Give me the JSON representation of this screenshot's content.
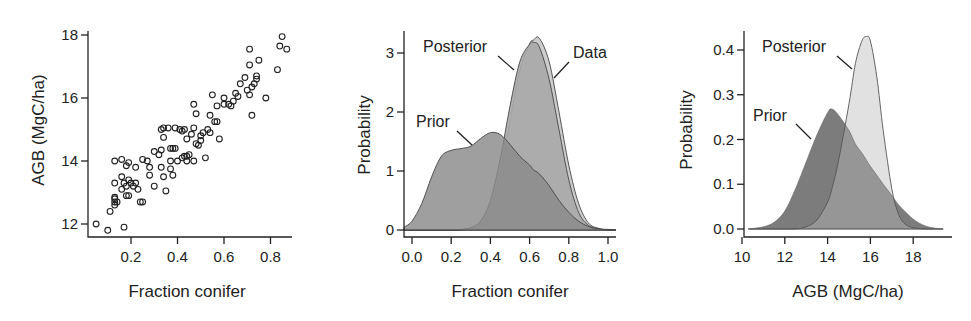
{
  "figure": {
    "panels": [
      {
        "id": "scatter",
        "xlabel": "Fraction conifer",
        "ylabel": "AGB (MgC/ha)"
      },
      {
        "id": "conifer-density",
        "xlabel": "Fraction conifer",
        "ylabel": "Probability",
        "annotations": [
          "Posterior",
          "Data",
          "Prior"
        ]
      },
      {
        "id": "agb-density",
        "xlabel": "AGB (MgC/ha)",
        "ylabel": "Probability",
        "annotations": [
          "Posterior",
          "Prior"
        ]
      }
    ]
  },
  "colors": {
    "prior_fill": "#8a8a8a",
    "posterior_fill": "#a8a8a8",
    "data_fill": "#c8c8c8",
    "overlap_fill": "#6e6e6e",
    "axis": "#222222",
    "point_stroke": "#222222"
  },
  "chart_data": [
    {
      "type": "scatter",
      "title": "",
      "xlabel": "Fraction conifer",
      "ylabel": "AGB (MgC/ha)",
      "xticks": [
        "0.2",
        "0.4",
        "0.6",
        "0.8"
      ],
      "yticks": [
        "12",
        "14",
        "16",
        "18"
      ],
      "xlim": [
        0.02,
        0.9
      ],
      "ylim": [
        11.6,
        18.1
      ],
      "grid": false,
      "points": [
        [
          0.05,
          12.0
        ],
        [
          0.1,
          11.8
        ],
        [
          0.17,
          11.9
        ],
        [
          0.11,
          12.4
        ],
        [
          0.13,
          12.6
        ],
        [
          0.13,
          12.8
        ],
        [
          0.13,
          12.7
        ],
        [
          0.14,
          12.7
        ],
        [
          0.13,
          12.85
        ],
        [
          0.13,
          13.3
        ],
        [
          0.16,
          13.5
        ],
        [
          0.16,
          13.1
        ],
        [
          0.17,
          13.3
        ],
        [
          0.18,
          13.2
        ],
        [
          0.19,
          13.4
        ],
        [
          0.2,
          13.3
        ],
        [
          0.21,
          13.2
        ],
        [
          0.22,
          13.3
        ],
        [
          0.23,
          13.1
        ],
        [
          0.18,
          12.9
        ],
        [
          0.19,
          12.9
        ],
        [
          0.24,
          12.7
        ],
        [
          0.25,
          12.7
        ],
        [
          0.13,
          14.0
        ],
        [
          0.16,
          14.05
        ],
        [
          0.18,
          13.85
        ],
        [
          0.19,
          13.95
        ],
        [
          0.22,
          13.8
        ],
        [
          0.25,
          14.05
        ],
        [
          0.27,
          14.0
        ],
        [
          0.28,
          13.8
        ],
        [
          0.28,
          13.55
        ],
        [
          0.3,
          13.2
        ],
        [
          0.3,
          14.3
        ],
        [
          0.32,
          14.2
        ],
        [
          0.33,
          14.35
        ],
        [
          0.33,
          13.8
        ],
        [
          0.34,
          13.5
        ],
        [
          0.35,
          13.05
        ],
        [
          0.37,
          14.0
        ],
        [
          0.37,
          13.75
        ],
        [
          0.38,
          13.55
        ],
        [
          0.4,
          14.0
        ],
        [
          0.42,
          14.1
        ],
        [
          0.33,
          15.0
        ],
        [
          0.34,
          15.05
        ],
        [
          0.36,
          15.05
        ],
        [
          0.39,
          15.05
        ],
        [
          0.41,
          15.0
        ],
        [
          0.42,
          14.95
        ],
        [
          0.43,
          15.0
        ],
        [
          0.34,
          14.75
        ],
        [
          0.37,
          14.4
        ],
        [
          0.38,
          14.4
        ],
        [
          0.39,
          14.4
        ],
        [
          0.43,
          14.15
        ],
        [
          0.44,
          14.15
        ],
        [
          0.45,
          14.2
        ],
        [
          0.44,
          14.0
        ],
        [
          0.47,
          14.0
        ],
        [
          0.44,
          14.7
        ],
        [
          0.46,
          14.85
        ],
        [
          0.47,
          15.05
        ],
        [
          0.48,
          14.55
        ],
        [
          0.49,
          14.5
        ],
        [
          0.5,
          14.65
        ],
        [
          0.5,
          14.8
        ],
        [
          0.51,
          14.9
        ],
        [
          0.47,
          15.8
        ],
        [
          0.48,
          15.5
        ],
        [
          0.53,
          15.0
        ],
        [
          0.54,
          15.45
        ],
        [
          0.54,
          14.9
        ],
        [
          0.52,
          14.1
        ],
        [
          0.56,
          15.25
        ],
        [
          0.57,
          15.25
        ],
        [
          0.58,
          14.7
        ],
        [
          0.55,
          16.1
        ],
        [
          0.57,
          15.75
        ],
        [
          0.6,
          16.0
        ],
        [
          0.6,
          15.8
        ],
        [
          0.62,
          15.8
        ],
        [
          0.63,
          15.75
        ],
        [
          0.64,
          15.9
        ],
        [
          0.65,
          16.15
        ],
        [
          0.66,
          16.05
        ],
        [
          0.67,
          16.45
        ],
        [
          0.69,
          16.65
        ],
        [
          0.7,
          16.25
        ],
        [
          0.71,
          16.1
        ],
        [
          0.72,
          16.35
        ],
        [
          0.73,
          16.45
        ],
        [
          0.74,
          16.6
        ],
        [
          0.74,
          16.7
        ],
        [
          0.72,
          15.45
        ],
        [
          0.71,
          17.05
        ],
        [
          0.71,
          17.55
        ],
        [
          0.75,
          17.2
        ],
        [
          0.78,
          16.0
        ],
        [
          0.83,
          16.9
        ],
        [
          0.84,
          17.65
        ],
        [
          0.85,
          17.95
        ],
        [
          0.87,
          17.55
        ]
      ]
    },
    {
      "type": "area",
      "title": "",
      "xlabel": "Fraction conifer",
      "ylabel": "Probability",
      "xticks": [
        "0.0",
        "0.2",
        "0.4",
        "0.6",
        "0.8",
        "1.0"
      ],
      "yticks": [
        "0",
        "1",
        "2",
        "3"
      ],
      "xlim": [
        -0.04,
        1.04
      ],
      "ylim": [
        0,
        3.4
      ],
      "grid": false,
      "x": [
        -0.04,
        0.0,
        0.05,
        0.1,
        0.15,
        0.2,
        0.25,
        0.3,
        0.35,
        0.4,
        0.45,
        0.5,
        0.55,
        0.6,
        0.62,
        0.65,
        0.7,
        0.75,
        0.8,
        0.85,
        0.9,
        0.95,
        1.0,
        1.04
      ],
      "series": [
        {
          "name": "Prior",
          "values": [
            0.05,
            0.15,
            0.45,
            0.9,
            1.25,
            1.35,
            1.38,
            1.42,
            1.55,
            1.65,
            1.62,
            1.45,
            1.25,
            1.1,
            1.02,
            0.95,
            0.75,
            0.5,
            0.3,
            0.15,
            0.06,
            0.02,
            0.01,
            0.0
          ]
        },
        {
          "name": "Posterior",
          "values": [
            0,
            0,
            0,
            0,
            0,
            0,
            0.01,
            0.04,
            0.15,
            0.5,
            1.2,
            2.1,
            2.85,
            3.15,
            3.18,
            3.1,
            2.55,
            1.7,
            0.85,
            0.3,
            0.08,
            0.02,
            0,
            0
          ]
        },
        {
          "name": "Data",
          "values": [
            0,
            0,
            0,
            0,
            0,
            0,
            0,
            0.02,
            0.08,
            0.35,
            0.95,
            1.85,
            2.7,
            3.15,
            3.22,
            3.25,
            2.85,
            2.0,
            1.1,
            0.45,
            0.12,
            0.03,
            0,
            0
          ]
        }
      ],
      "annotations": [
        "Posterior",
        "Data",
        "Prior"
      ]
    },
    {
      "type": "area",
      "title": "",
      "xlabel": "AGB (MgC/ha)",
      "ylabel": "Probability",
      "xticks": [
        "10",
        "12",
        "14",
        "16",
        "18"
      ],
      "yticks": [
        "0.0",
        "0.1",
        "0.2",
        "0.3",
        "0.4"
      ],
      "xlim": [
        10,
        19.5
      ],
      "ylim": [
        0,
        0.44
      ],
      "grid": false,
      "x": [
        10.3,
        11.0,
        11.5,
        12.0,
        12.5,
        13.0,
        13.5,
        14.0,
        14.2,
        14.5,
        15.0,
        15.3,
        15.6,
        15.8,
        16.0,
        16.3,
        16.6,
        17.0,
        17.3,
        17.6,
        18.0,
        18.5,
        19.0,
        19.4
      ],
      "series": [
        {
          "name": "Prior",
          "values": [
            0.0,
            0.005,
            0.015,
            0.04,
            0.09,
            0.15,
            0.21,
            0.26,
            0.268,
            0.255,
            0.22,
            0.19,
            0.17,
            0.155,
            0.14,
            0.12,
            0.1,
            0.075,
            0.055,
            0.04,
            0.022,
            0.008,
            0.002,
            0.0
          ]
        },
        {
          "name": "Posterior",
          "values": [
            0,
            0,
            0,
            0,
            0,
            0.005,
            0.02,
            0.06,
            0.09,
            0.15,
            0.28,
            0.37,
            0.42,
            0.43,
            0.42,
            0.34,
            0.22,
            0.09,
            0.035,
            0.012,
            0.003,
            0,
            0,
            0
          ]
        }
      ],
      "annotations": [
        "Posterior",
        "Prior"
      ]
    }
  ]
}
